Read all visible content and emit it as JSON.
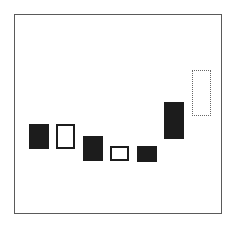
{
  "diagram": {
    "type": "candlestick-bodies",
    "frame": {
      "left": 14,
      "top": 14,
      "width": 208,
      "height": 200,
      "border_color": "#5a5a5a"
    },
    "colors": {
      "filled": "#1c1c1c",
      "hollow_border": "#1c1c1c",
      "dotted_border": "#666666"
    },
    "candles": [
      {
        "index": 1,
        "style": "filled",
        "x": 29,
        "y": 124,
        "w": 20,
        "h": 25
      },
      {
        "index": 2,
        "style": "hollow",
        "x": 56,
        "y": 124,
        "w": 19,
        "h": 25
      },
      {
        "index": 3,
        "style": "filled",
        "x": 83,
        "y": 136,
        "w": 20,
        "h": 25
      },
      {
        "index": 4,
        "style": "hollow",
        "x": 110,
        "y": 146,
        "w": 19,
        "h": 15
      },
      {
        "index": 5,
        "style": "filled",
        "x": 137,
        "y": 146,
        "w": 20,
        "h": 16
      },
      {
        "index": 6,
        "style": "filled",
        "x": 164,
        "y": 102,
        "w": 20,
        "h": 37
      },
      {
        "index": 7,
        "style": "dotted",
        "x": 192,
        "y": 70,
        "w": 19,
        "h": 46
      }
    ]
  }
}
